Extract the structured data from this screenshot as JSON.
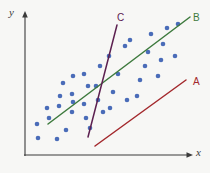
{
  "figure": {
    "background_color": "#f7f7f5",
    "axis_color": "#3b3b3b",
    "width": 210,
    "height": 173
  },
  "axes": {
    "y_label": "y",
    "x_label": "x",
    "y_axis_x": 25,
    "y_axis_top": 15,
    "x_axis_y": 155,
    "x_axis_right": 192
  },
  "chart_data": {
    "type": "scatter",
    "title": "",
    "xlabel": "x",
    "ylabel": "y",
    "grid": false,
    "legend": "none",
    "axis_ticks": [],
    "xlim": [
      25,
      200
    ],
    "ylim": [
      155,
      15
    ],
    "series": [
      {
        "name": "data-points",
        "type": "scatter",
        "color": "#4a6cb8",
        "marker": "circle",
        "marker_size": 4.6,
        "count": 40,
        "points": [
          [
            38,
            138
          ],
          [
            57,
            139
          ],
          [
            66,
            130
          ],
          [
            37,
            124
          ],
          [
            49,
            118
          ],
          [
            47,
            108
          ],
          [
            59,
            106
          ],
          [
            72,
            112
          ],
          [
            73,
            102
          ],
          [
            60,
            96
          ],
          [
            72,
            94
          ],
          [
            84,
            104
          ],
          [
            86,
            118
          ],
          [
            90,
            128
          ],
          [
            98,
            100
          ],
          [
            96,
            86
          ],
          [
            88,
            86
          ],
          [
            84,
            74
          ],
          [
            73,
            76
          ],
          [
            63,
            83
          ],
          [
            103,
            112
          ],
          [
            110,
            108
          ],
          [
            113,
            92
          ],
          [
            100,
            66
          ],
          [
            109,
            56
          ],
          [
            118,
            74
          ],
          [
            125,
            46
          ],
          [
            130,
            40
          ],
          [
            127,
            100
          ],
          [
            137,
            96
          ],
          [
            140,
            80
          ],
          [
            145,
            66
          ],
          [
            148,
            52
          ],
          [
            151,
            34
          ],
          [
            158,
            76
          ],
          [
            161,
            60
          ],
          [
            163,
            44
          ],
          [
            167,
            28
          ],
          [
            175,
            56
          ],
          [
            178,
            24
          ]
        ]
      }
    ],
    "lines": [
      {
        "name": "line-A",
        "label": "A",
        "color": "#a3282c",
        "x1": 95,
        "y1": 146,
        "x2": 186,
        "y2": 80,
        "label_x": 193,
        "label_y": 77,
        "description": "lower right line, poor fit, offset below the data cloud"
      },
      {
        "name": "line-B",
        "label": "B",
        "color": "#3d7a3d",
        "x1": 48,
        "y1": 124,
        "x2": 190,
        "y2": 17,
        "label_x": 193,
        "label_y": 13,
        "description": "best fit line through the centre of the data cloud"
      },
      {
        "name": "line-C",
        "label": "C",
        "color": "#5c2050",
        "x1": 117,
        "y1": 25,
        "x2": 88,
        "y2": 137,
        "label_x": 117,
        "label_y": 13,
        "description": "steep line crossing the data cloud, poor fit"
      }
    ]
  }
}
